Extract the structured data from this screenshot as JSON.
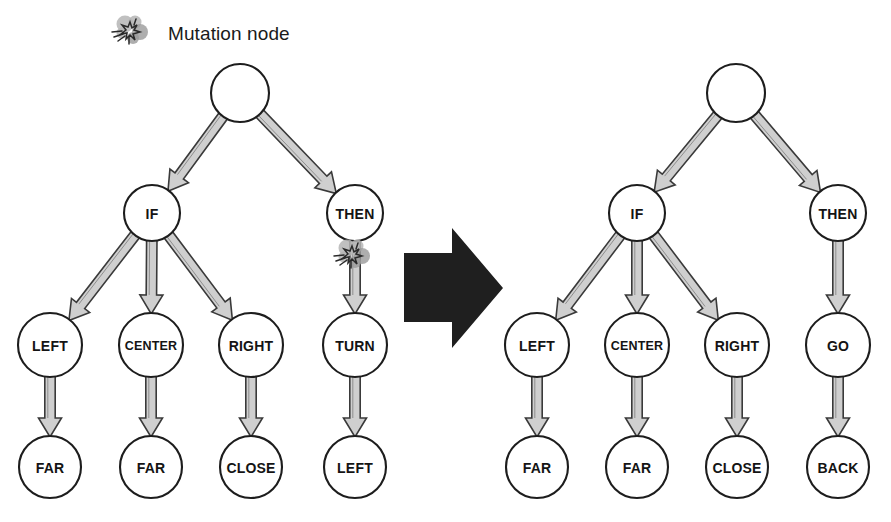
{
  "legend": {
    "label": "Mutation node",
    "icon": "explosion-burst-icon"
  },
  "transform_arrow": {
    "icon": "right-arrow-icon",
    "direction": "right"
  },
  "colors": {
    "node_stroke": "#1d1d1d",
    "node_fill": "#ffffff",
    "edge_fill": "#cfcfcf",
    "edge_stroke": "#3a3a3a",
    "arrow_fill": "#1f1f1f",
    "text": "#141414",
    "background": "#ffffff"
  },
  "trees": [
    {
      "id": "before",
      "caption": "",
      "nodes": [
        {
          "id": "b_root",
          "label": "",
          "cx": 240,
          "cy": 93,
          "r": 29,
          "mutation": false
        },
        {
          "id": "b_if",
          "label": "IF",
          "cx": 152,
          "cy": 213,
          "r": 28,
          "mutation": false
        },
        {
          "id": "b_then",
          "label": "THEN",
          "cx": 355,
          "cy": 213,
          "r": 28,
          "mutation": true
        },
        {
          "id": "b_left",
          "label": "LEFT",
          "cx": 50,
          "cy": 345,
          "r": 32,
          "mutation": false
        },
        {
          "id": "b_center",
          "label": "CENTER",
          "cx": 151,
          "cy": 345,
          "r": 32,
          "mutation": false
        },
        {
          "id": "b_right",
          "label": "RIGHT",
          "cx": 251,
          "cy": 345,
          "r": 32,
          "mutation": false
        },
        {
          "id": "b_turn",
          "label": "TURN",
          "cx": 355,
          "cy": 345,
          "r": 32,
          "mutation": false
        },
        {
          "id": "b_far1",
          "label": "FAR",
          "cx": 50,
          "cy": 467,
          "r": 31,
          "mutation": false
        },
        {
          "id": "b_far2",
          "label": "FAR",
          "cx": 151,
          "cy": 467,
          "r": 31,
          "mutation": false
        },
        {
          "id": "b_close",
          "label": "CLOSE",
          "cx": 251,
          "cy": 467,
          "r": 31,
          "mutation": false
        },
        {
          "id": "b_leftl",
          "label": "LEFT",
          "cx": 355,
          "cy": 467,
          "r": 31,
          "mutation": false
        }
      ],
      "edges": [
        {
          "from": "b_root",
          "to": "b_if"
        },
        {
          "from": "b_root",
          "to": "b_then"
        },
        {
          "from": "b_if",
          "to": "b_left"
        },
        {
          "from": "b_if",
          "to": "b_center"
        },
        {
          "from": "b_if",
          "to": "b_right"
        },
        {
          "from": "b_then",
          "to": "b_turn"
        },
        {
          "from": "b_left",
          "to": "b_far1"
        },
        {
          "from": "b_center",
          "to": "b_far2"
        },
        {
          "from": "b_right",
          "to": "b_close"
        },
        {
          "from": "b_turn",
          "to": "b_leftl"
        }
      ]
    },
    {
      "id": "after",
      "caption": "",
      "nodes": [
        {
          "id": "a_root",
          "label": "",
          "cx": 736,
          "cy": 93,
          "r": 29,
          "mutation": false
        },
        {
          "id": "a_if",
          "label": "IF",
          "cx": 637,
          "cy": 213,
          "r": 28,
          "mutation": false
        },
        {
          "id": "a_then",
          "label": "THEN",
          "cx": 838,
          "cy": 213,
          "r": 28,
          "mutation": false
        },
        {
          "id": "a_left",
          "label": "LEFT",
          "cx": 537,
          "cy": 345,
          "r": 32,
          "mutation": false
        },
        {
          "id": "a_center",
          "label": "CENTER",
          "cx": 637,
          "cy": 345,
          "r": 32,
          "mutation": false
        },
        {
          "id": "a_right",
          "label": "RIGHT",
          "cx": 737,
          "cy": 345,
          "r": 32,
          "mutation": false
        },
        {
          "id": "a_go",
          "label": "GO",
          "cx": 838,
          "cy": 345,
          "r": 32,
          "mutation": false
        },
        {
          "id": "a_far1",
          "label": "FAR",
          "cx": 537,
          "cy": 467,
          "r": 31,
          "mutation": false
        },
        {
          "id": "a_far2",
          "label": "FAR",
          "cx": 637,
          "cy": 467,
          "r": 31,
          "mutation": false
        },
        {
          "id": "a_close",
          "label": "CLOSE",
          "cx": 737,
          "cy": 467,
          "r": 31,
          "mutation": false
        },
        {
          "id": "a_back",
          "label": "BACK",
          "cx": 838,
          "cy": 467,
          "r": 31,
          "mutation": false
        }
      ],
      "edges": [
        {
          "from": "a_root",
          "to": "a_if"
        },
        {
          "from": "a_root",
          "to": "a_then"
        },
        {
          "from": "a_if",
          "to": "a_left"
        },
        {
          "from": "a_if",
          "to": "a_center"
        },
        {
          "from": "a_if",
          "to": "a_right"
        },
        {
          "from": "a_then",
          "to": "a_go"
        },
        {
          "from": "a_left",
          "to": "a_far1"
        },
        {
          "from": "a_center",
          "to": "a_far2"
        },
        {
          "from": "a_right",
          "to": "a_close"
        },
        {
          "from": "a_go",
          "to": "a_back"
        }
      ]
    }
  ]
}
